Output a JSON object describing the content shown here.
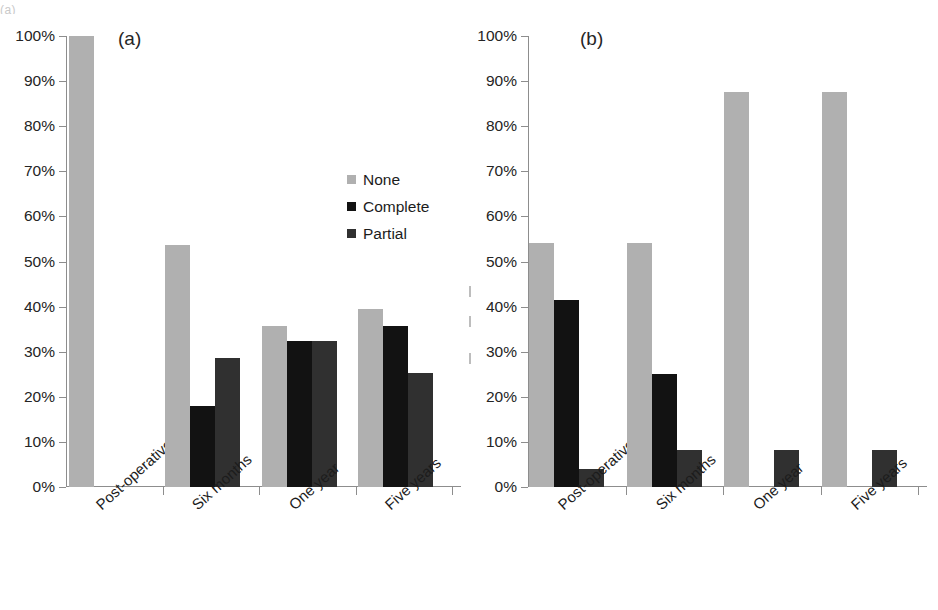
{
  "figure": {
    "top_crop_text": "(a)",
    "background": "#ffffff"
  },
  "colors": {
    "none": "#b0b0b0",
    "complete": "#121212",
    "partial": "#303030",
    "axis": "#8d8d8d",
    "text": "#1c1c1c"
  },
  "legend": {
    "position": "inside-panel-a",
    "entries": [
      {
        "label": "None",
        "color": "#b0b0b0"
      },
      {
        "label": "Complete",
        "color": "#121212"
      },
      {
        "label": "Partial",
        "color": "#303030"
      }
    ]
  },
  "y_axis": {
    "ticks": [
      "0%",
      "10%",
      "20%",
      "30%",
      "40%",
      "50%",
      "60%",
      "70%",
      "80%",
      "90%",
      "100%"
    ],
    "min": 0,
    "max": 100,
    "step": 10
  },
  "panels": [
    {
      "tag": "(a)"
    },
    {
      "tag": "(b)"
    }
  ],
  "chart_data": [
    {
      "type": "bar",
      "title": "(a)",
      "xlabel": "",
      "ylabel": "",
      "ylim": [
        0,
        100
      ],
      "ytick_labels": [
        "0%",
        "10%",
        "20%",
        "30%",
        "40%",
        "50%",
        "60%",
        "70%",
        "80%",
        "90%",
        "100%"
      ],
      "grid": false,
      "legend_position": "inside-upper-right",
      "categories": [
        "Post-operative",
        "Six months",
        "One year",
        "Five years"
      ],
      "series": [
        {
          "name": "None",
          "color": "#b0b0b0",
          "values": [
            100.0,
            53.7,
            35.7,
            39.5
          ]
        },
        {
          "name": "Complete",
          "color": "#121212",
          "values": [
            0.0,
            17.9,
            32.3,
            35.8
          ]
        },
        {
          "name": "Partial",
          "color": "#303030",
          "values": [
            0.0,
            28.6,
            32.3,
            25.3
          ]
        }
      ]
    },
    {
      "type": "bar",
      "title": "(b)",
      "xlabel": "",
      "ylabel": "",
      "ylim": [
        0,
        100
      ],
      "ytick_labels": [
        "0%",
        "10%",
        "20%",
        "30%",
        "40%",
        "50%",
        "60%",
        "70%",
        "80%",
        "90%",
        "100%"
      ],
      "grid": false,
      "legend_position": "none",
      "categories": [
        "Post-operative",
        "Six months",
        "One year",
        "Five years"
      ],
      "series": [
        {
          "name": "None",
          "color": "#b0b0b0",
          "values": [
            54.0,
            54.0,
            87.5,
            87.5
          ]
        },
        {
          "name": "Complete",
          "color": "#121212",
          "values": [
            41.5,
            25.0,
            0.0,
            0.0
          ]
        },
        {
          "name": "Partial",
          "color": "#303030",
          "values": [
            4.0,
            8.3,
            8.3,
            8.3
          ]
        }
      ]
    }
  ]
}
